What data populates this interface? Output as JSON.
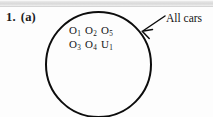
{
  "figure": {
    "question_label": {
      "number": "1.",
      "part": "(a)"
    },
    "caption": "All cars",
    "set_elements": [
      [
        {
          "base": "O",
          "sub": "1"
        },
        {
          "base": "O",
          "sub": "2"
        },
        {
          "base": "O",
          "sub": "5"
        }
      ],
      [
        {
          "base": "O",
          "sub": "3"
        },
        {
          "base": "O",
          "sub": "4"
        },
        {
          "base": "U",
          "sub": "1"
        }
      ]
    ],
    "colors": {
      "ink": "#0c0c0c",
      "paper": "#fdfdfd",
      "scan_band": "#d9d9d9"
    }
  }
}
